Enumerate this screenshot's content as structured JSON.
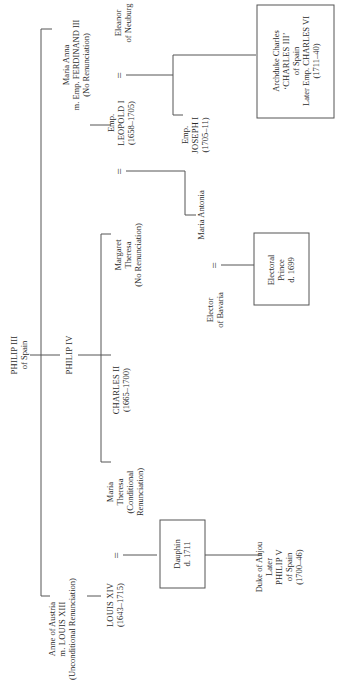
{
  "diagram": {
    "nodes": {
      "philip3": {
        "lines": [
          "PHILIP III",
          "of Spain"
        ]
      },
      "philip4": {
        "lines": [
          "PHILIP IV"
        ]
      },
      "maria_anna": {
        "lines": [
          "Maria Anna",
          "m. Emp. FERDINAND III",
          "(No Renunciation)"
        ]
      },
      "leopold": {
        "lines": [
          "Emp.",
          "LEOPOLD I",
          "(1658–1705)"
        ]
      },
      "eleanor": {
        "lines": [
          "Eleanor",
          "of Neuburg"
        ]
      },
      "joseph": {
        "lines": [
          "Emp.",
          "JOSEPH I",
          "(1705–11)"
        ]
      },
      "archduke_charles": {
        "lines": [
          "Archduke Charles",
          "‘CHARLES III’",
          "of Spain",
          "Later Emp. CHARLES VI",
          "(1711–40)"
        ]
      },
      "margaret_theresa": {
        "lines": [
          "Margaret",
          "Theresa",
          "(No Renunciation)"
        ]
      },
      "maria_antonia": {
        "lines": [
          "Maria Antonia"
        ]
      },
      "elector_bavaria": {
        "lines": [
          "Elector",
          "of Bavaria"
        ]
      },
      "electoral_prince": {
        "lines": [
          "Electoral",
          "Prince",
          "d. 1699"
        ]
      },
      "charles2": {
        "lines": [
          "CHARLES II",
          "(1665–1700)"
        ]
      },
      "maria_theresa": {
        "lines": [
          "Maria",
          "Theresa",
          "(Conditional",
          "Renunciation)"
        ]
      },
      "anne_austria": {
        "lines": [
          "Anne of Austria",
          "m. LOUIS XIII",
          "(Unconditional Renunciation)"
        ]
      },
      "louis14": {
        "lines": [
          "LOUIS XIV",
          "(1643–1715)"
        ]
      },
      "dauphin": {
        "lines": [
          "Dauphin",
          "d. 1711"
        ]
      },
      "duke_anjou": {
        "lines": [
          "Duke of Anjou",
          "Later",
          "PHILIP V",
          "of Spain",
          "(1700–46)"
        ]
      }
    },
    "marriage_symbol": "="
  }
}
